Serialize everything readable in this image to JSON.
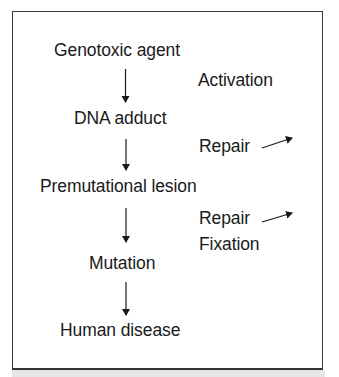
{
  "diagram": {
    "pathway": [
      {
        "id": "genotoxic-agent",
        "label": "Genotoxic agent"
      },
      {
        "id": "dna-adduct",
        "label": "DNA adduct"
      },
      {
        "id": "premutational-lesion",
        "label": "Premutational lesion"
      },
      {
        "id": "mutation",
        "label": "Mutation"
      },
      {
        "id": "human-disease",
        "label": "Human disease"
      }
    ],
    "side_processes": [
      {
        "label": "Activation",
        "between": [
          "Genotoxic agent",
          "DNA adduct"
        ],
        "outflow_arrow": false
      },
      {
        "label": "Repair",
        "between": [
          "DNA adduct",
          "Premutational lesion"
        ],
        "outflow_arrow": true
      },
      {
        "label": "Repair",
        "between": [
          "Premutational lesion",
          "Mutation"
        ],
        "outflow_arrow": true
      },
      {
        "label": "Fixation",
        "between": [
          "Premutational lesion",
          "Mutation"
        ],
        "outflow_arrow": false
      }
    ],
    "colors": {
      "text": "#1a1a1a",
      "border": "#3a3a3a",
      "background": "#ffffff"
    }
  }
}
